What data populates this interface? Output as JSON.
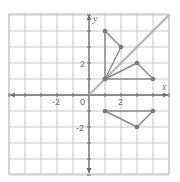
{
  "figure": {
    "type": "coordinate-plane",
    "x_axis_label": "x",
    "y_axis_label": "y",
    "origin_label": "0",
    "x_tick_labels": [
      {
        "value": -2,
        "text": "-2"
      },
      {
        "value": 2,
        "text": "2"
      }
    ],
    "y_tick_labels": [
      {
        "value": 2,
        "text": "2"
      },
      {
        "value": -2,
        "text": "-2"
      }
    ],
    "x_range": [
      -5,
      5
    ],
    "y_range": [
      -5,
      5
    ],
    "grid": true,
    "colors": {
      "grid": "#c8c8c8",
      "axes": "#6e6e6e",
      "shapes": "#8a8a8a",
      "points": "#7a7a7a",
      "reference_line": "#b0b0b0"
    },
    "reference_line": {
      "equation": "y = x",
      "from": [
        0,
        0
      ],
      "to": [
        5,
        5
      ]
    },
    "shapes": [
      {
        "name": "triangle-above-line",
        "vertices": [
          [
            1,
            4
          ],
          [
            2,
            3
          ],
          [
            1,
            1
          ]
        ]
      },
      {
        "name": "triangle-below-line",
        "vertices": [
          [
            1,
            1
          ],
          [
            3,
            2
          ],
          [
            4,
            1
          ]
        ]
      },
      {
        "name": "triangle-below-x-axis",
        "vertices": [
          [
            1,
            -1
          ],
          [
            4,
            -1
          ],
          [
            3,
            -2
          ]
        ]
      }
    ]
  }
}
